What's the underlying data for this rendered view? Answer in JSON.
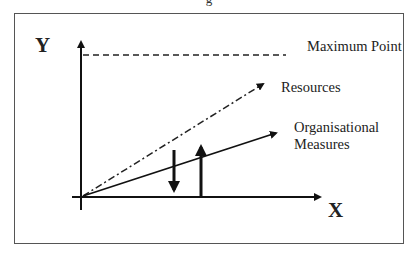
{
  "caption_fragment": "g",
  "diagram": {
    "axes": {
      "y_label": "Y",
      "x_label": "X"
    },
    "lines": [
      {
        "name": "maximum-point",
        "label": "Maximum Point",
        "style": "dashed"
      },
      {
        "name": "resources",
        "label": "Resources",
        "style": "dash-dot",
        "arrow": true
      },
      {
        "name": "organisational-measures",
        "label_line1": "Organisational",
        "label_line2": "Measures",
        "style": "solid",
        "arrow": true
      }
    ],
    "vertical_arrows": [
      {
        "name": "down-arrow",
        "direction": "down"
      },
      {
        "name": "up-arrow",
        "direction": "up"
      }
    ]
  }
}
